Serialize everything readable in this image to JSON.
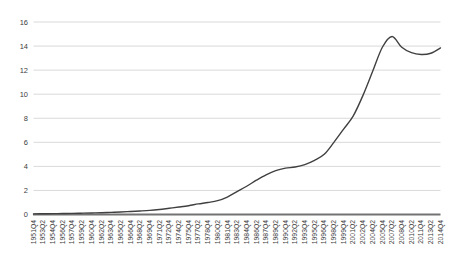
{
  "chart": {
    "background_color": "#ffffff",
    "line_color": "#404040",
    "grid_color": "#d9d9d9",
    "axis_color": "#737373",
    "tick_label_color": "#404040",
    "plot": {
      "left": 33.5,
      "right": 440.5,
      "top": 22,
      "bottom": 214.5
    }
  },
  "chart_data": {
    "type": "line",
    "title": "",
    "xlabel": "",
    "ylabel": "",
    "legend": "none",
    "grid": "horizontal",
    "ylim": [
      0,
      16
    ],
    "ytick_step": 2,
    "yticks": [
      "0",
      "2",
      "4",
      "6",
      "8",
      "10",
      "12",
      "14",
      "16"
    ],
    "x": [
      "1951Q4",
      "1953Q2",
      "1954Q4",
      "1956Q2",
      "1957Q4",
      "1959Q2",
      "1960Q4",
      "1962Q2",
      "1963Q4",
      "1965Q2",
      "1966Q4",
      "1968Q2",
      "1969Q4",
      "1971Q2",
      "1972Q4",
      "1974Q2",
      "1975Q4",
      "1977Q2",
      "1978Q4",
      "1980Q2",
      "1981Q4",
      "1983Q2",
      "1984Q4",
      "1986Q2",
      "1987Q4",
      "1989Q2",
      "1990Q4",
      "1992Q2",
      "1993Q4",
      "1995Q2",
      "1996Q4",
      "1998Q2",
      "1999Q4",
      "2001Q2",
      "2002Q4",
      "2004Q2",
      "2005Q4",
      "2007Q2",
      "2008Q4",
      "2010Q2",
      "2011Q4",
      "2013Q2",
      "2014Q4"
    ],
    "values": [
      0.05,
      0.06,
      0.07,
      0.08,
      0.09,
      0.11,
      0.13,
      0.15,
      0.18,
      0.21,
      0.25,
      0.29,
      0.34,
      0.42,
      0.52,
      0.62,
      0.73,
      0.88,
      1.0,
      1.15,
      1.45,
      1.9,
      2.35,
      2.85,
      3.3,
      3.65,
      3.85,
      3.95,
      4.15,
      4.5,
      5.0,
      6.0,
      7.1,
      8.2,
      9.9,
      11.9,
      13.9,
      14.8,
      13.9,
      13.45,
      13.3,
      13.4,
      13.85
    ]
  }
}
